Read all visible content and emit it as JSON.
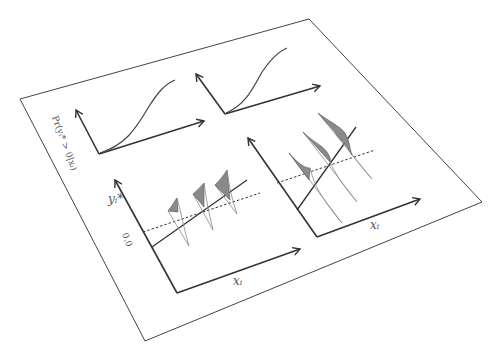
{
  "figure": {
    "top_left_panel": {
      "ylabel": "Pr(yᵢ* > 0|xᵢ)",
      "curve": "sigmoid"
    },
    "top_right_panel": {
      "curve": "sigmoid"
    },
    "bottom_left_panel": {
      "ylabel": "yᵢ*",
      "threshold_label": "0.0",
      "xlabel": "xᵢ",
      "densities": 3
    },
    "bottom_right_panel": {
      "xlabel": "xᵢ",
      "densities": 3
    }
  }
}
